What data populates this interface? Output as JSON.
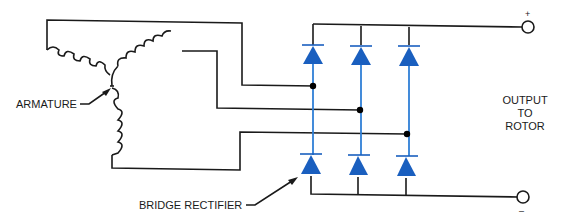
{
  "labels": {
    "armature": "ARMATURE",
    "bridge_rectifier": "BRIDGE RECTIFIER",
    "output_line1": "OUTPUT",
    "output_line2": "TO",
    "output_line3": "ROTOR",
    "positive": "+",
    "negative": "–"
  },
  "colors": {
    "diode": "#1a5fbf",
    "rectifier_wire": "#2f7fd6",
    "wire": "#1a1a1a"
  },
  "components": {
    "armature_windings": 3,
    "diodes": 6,
    "junction_dots": 3,
    "output_terminals": 2
  }
}
